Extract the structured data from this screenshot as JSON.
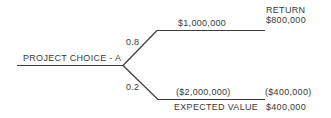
{
  "diagram": {
    "type": "decision-tree",
    "root": {
      "label": "PROJECT CHOICE - A"
    },
    "branches": [
      {
        "probability": "0.8",
        "outcome": "$1,000,000",
        "return": "$800,000"
      },
      {
        "probability": "0.2",
        "outcome": "($2,000,000)",
        "return": "($400,000)"
      }
    ],
    "return_header": "RETURN",
    "expected_value_label": "EXPECTED VALUE",
    "expected_value": "$400,000",
    "line_color": "#3a3a3a"
  }
}
